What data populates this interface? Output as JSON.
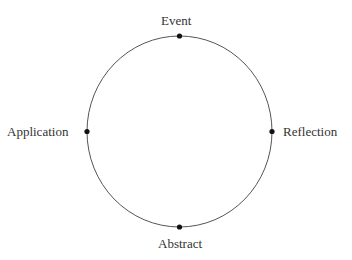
{
  "diagram": {
    "type": "cycle",
    "circle": {
      "cx": 179.5,
      "cy": 131.5,
      "rx": 92.5,
      "ry": 95.5,
      "stroke": "#555555"
    },
    "nodes": [
      {
        "id": "event",
        "label": "Event",
        "position": "top"
      },
      {
        "id": "reflection",
        "label": "Reflection",
        "position": "right"
      },
      {
        "id": "abstract",
        "label": "Abstract",
        "position": "bottom"
      },
      {
        "id": "application",
        "label": "Application",
        "position": "left"
      }
    ],
    "dot_color": "#111111",
    "text_color": "#333333"
  }
}
